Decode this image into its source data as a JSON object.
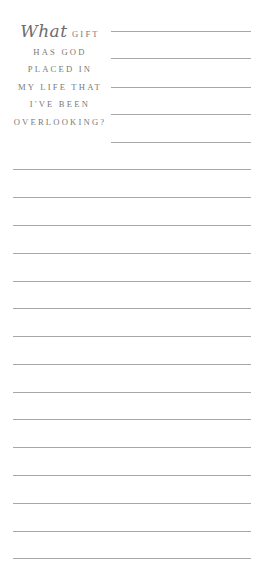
{
  "prompt": {
    "script_word": "What",
    "lines": [
      "GIFT",
      "HAS GOD",
      "PLACED IN",
      "MY LIFE THAT",
      "I'VE BEEN",
      "OVERLOOKING?"
    ]
  },
  "writing_lines": {
    "short_count": 5,
    "long_count": 15,
    "line_color": "#a8a8a8"
  }
}
